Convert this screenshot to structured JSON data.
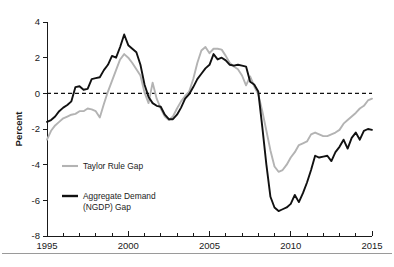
{
  "chart_data": {
    "type": "line",
    "title": "",
    "xlabel": "",
    "ylabel": "Percent",
    "xlim": [
      1995,
      2015
    ],
    "ylim": [
      -8,
      4
    ],
    "yticks": [
      4,
      2,
      0,
      -2,
      -4,
      -6,
      -8
    ],
    "ytick_labels": [
      "4",
      "2",
      "0",
      "-2",
      "-4",
      "-6",
      "-8"
    ],
    "xticks": [
      1995,
      2000,
      2005,
      2010,
      2015
    ],
    "xtick_labels": [
      "1995",
      "2000",
      "2005",
      "2010",
      "2015"
    ],
    "x_minor_tick_interval": 1,
    "grid": false,
    "zero_reference_line": {
      "value": 0,
      "style": "dashed",
      "color": "#111111"
    },
    "legend_position": "inside-lower-left",
    "series": [
      {
        "name": "Taylor Rule Gap",
        "color": "#b3b3b3",
        "x": [
          1995.0,
          1995.25,
          1995.5,
          1995.75,
          1996.0,
          1996.25,
          1996.5,
          1996.75,
          1997.0,
          1997.25,
          1997.5,
          1997.75,
          1998.0,
          1998.25,
          1998.5,
          1998.75,
          1999.0,
          1999.25,
          1999.5,
          1999.75,
          2000.0,
          2000.25,
          2000.5,
          2000.75,
          2001.0,
          2001.25,
          2001.5,
          2001.75,
          2002.0,
          2002.25,
          2002.5,
          2002.75,
          2003.0,
          2003.25,
          2003.5,
          2003.75,
          2004.0,
          2004.25,
          2004.5,
          2004.75,
          2005.0,
          2005.25,
          2005.5,
          2005.75,
          2006.0,
          2006.25,
          2006.5,
          2006.75,
          2007.0,
          2007.25,
          2007.5,
          2007.75,
          2008.0,
          2008.25,
          2008.5,
          2008.75,
          2009.0,
          2009.25,
          2009.5,
          2009.75,
          2010.0,
          2010.25,
          2010.5,
          2010.75,
          2011.0,
          2011.25,
          2011.5,
          2011.75,
          2012.0,
          2012.25,
          2012.5,
          2012.75,
          2013.0,
          2013.25,
          2013.5,
          2013.75,
          2014.0,
          2014.25,
          2014.5,
          2014.75,
          2015.0
        ],
        "y": [
          -2.6,
          -2.1,
          -1.8,
          -1.6,
          -1.4,
          -1.3,
          -1.2,
          -1.15,
          -1.0,
          -1.0,
          -0.85,
          -0.9,
          -1.0,
          -1.35,
          -0.6,
          0.1,
          0.7,
          1.3,
          1.9,
          2.2,
          2.0,
          1.7,
          1.35,
          1.0,
          0.05,
          -0.55,
          0.6,
          -0.3,
          -0.85,
          -1.3,
          -1.5,
          -1.3,
          -0.85,
          -0.45,
          -0.15,
          0.1,
          0.8,
          1.7,
          2.4,
          2.6,
          2.25,
          2.5,
          2.5,
          2.45,
          2.1,
          1.7,
          1.5,
          1.35,
          1.0,
          0.45,
          0.95,
          0.4,
          -0.05,
          -1.0,
          -2.1,
          -3.2,
          -4.1,
          -4.4,
          -4.3,
          -4.0,
          -3.6,
          -3.3,
          -2.9,
          -2.8,
          -2.7,
          -2.3,
          -2.2,
          -2.3,
          -2.4,
          -2.4,
          -2.3,
          -2.2,
          -2.05,
          -1.7,
          -1.5,
          -1.3,
          -1.1,
          -0.85,
          -0.7,
          -0.4,
          -0.3
        ]
      },
      {
        "name": "Aggregate Demand (NGDP) Gap",
        "legend_line1": "Aggregate Demand",
        "legend_line2": "(NGDP) Gap",
        "color": "#111111",
        "x": [
          1995.0,
          1995.25,
          1995.5,
          1995.75,
          1996.0,
          1996.25,
          1996.5,
          1996.75,
          1997.0,
          1997.25,
          1997.5,
          1997.75,
          1998.0,
          1998.25,
          1998.5,
          1998.75,
          1999.0,
          1999.25,
          1999.5,
          1999.75,
          2000.0,
          2000.25,
          2000.5,
          2000.75,
          2001.0,
          2001.25,
          2001.5,
          2001.75,
          2002.0,
          2002.25,
          2002.5,
          2002.75,
          2003.0,
          2003.25,
          2003.5,
          2003.75,
          2004.0,
          2004.25,
          2004.5,
          2004.75,
          2005.0,
          2005.25,
          2005.5,
          2005.75,
          2006.0,
          2006.25,
          2006.5,
          2006.75,
          2007.0,
          2007.25,
          2007.5,
          2007.75,
          2008.0,
          2008.25,
          2008.5,
          2008.75,
          2009.0,
          2009.25,
          2009.5,
          2009.75,
          2010.0,
          2010.25,
          2010.5,
          2010.75,
          2011.0,
          2011.25,
          2011.5,
          2011.75,
          2012.0,
          2012.25,
          2012.5,
          2012.75,
          2013.0,
          2013.25,
          2013.5,
          2013.75,
          2014.0,
          2014.25,
          2014.5,
          2014.75,
          2015.0
        ],
        "y": [
          -1.6,
          -1.5,
          -1.3,
          -1.0,
          -0.8,
          -0.65,
          -0.45,
          0.35,
          0.4,
          0.2,
          0.25,
          0.8,
          0.85,
          0.9,
          1.3,
          1.6,
          2.1,
          2.0,
          2.6,
          3.3,
          2.7,
          2.5,
          2.3,
          1.6,
          0.5,
          -0.2,
          -0.55,
          -0.7,
          -0.75,
          -1.2,
          -1.45,
          -1.45,
          -1.2,
          -0.8,
          -0.3,
          -0.05,
          0.35,
          0.8,
          1.1,
          1.4,
          1.6,
          2.2,
          1.9,
          2.0,
          1.85,
          1.6,
          1.55,
          1.6,
          1.55,
          1.5,
          0.65,
          0.5,
          0.1,
          -1.9,
          -4.0,
          -5.8,
          -6.4,
          -6.6,
          -6.5,
          -6.4,
          -6.2,
          -5.7,
          -6.1,
          -5.6,
          -5.0,
          -4.3,
          -3.5,
          -3.6,
          -3.55,
          -3.5,
          -3.8,
          -3.3,
          -3.0,
          -2.6,
          -3.1,
          -2.5,
          -2.2,
          -2.6,
          -2.1,
          -2.0,
          -2.05
        ]
      }
    ]
  },
  "axes": {
    "y_axis_title": "Percent"
  },
  "legend": {
    "items": [
      {
        "label": "Taylor Rule Gap",
        "color": "#b3b3b3"
      },
      {
        "label": "Aggregate Demand",
        "label2": "(NGDP) Gap",
        "color": "#111111"
      }
    ]
  }
}
